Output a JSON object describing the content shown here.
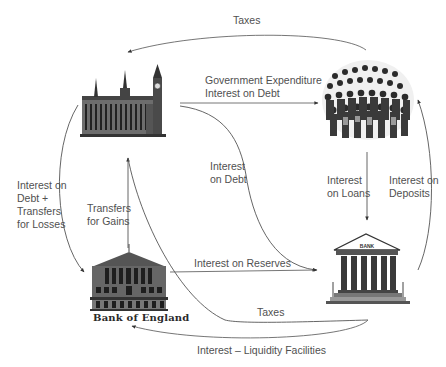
{
  "diagram": {
    "nodes": {
      "government": {
        "name": "Government (Houses of Parliament)",
        "icon": "parliament-icon"
      },
      "public": {
        "name": "Households & Firms (people crowd)",
        "icon": "crowd-icon"
      },
      "central_bank": {
        "name": "Bank of England",
        "caption": "Bank of England",
        "icon": "bank-of-england-icon"
      },
      "commercial_banks": {
        "name": "Commercial Banks",
        "sign": "BANK",
        "icon": "commercial-bank-icon"
      }
    },
    "flows": {
      "taxes_public_to_gov": {
        "label": "Taxes",
        "from": "public",
        "to": "government"
      },
      "gov_expenditure": {
        "label": "Government Expenditure\nInterest on Debt",
        "from": "government",
        "to": "public"
      },
      "interest_on_debt_gov_to_banks": {
        "label": "Interest\non Debt",
        "from": "government",
        "to": "commercial_banks"
      },
      "interest_loans": {
        "label": "Interest\non Loans",
        "from": "public",
        "to": "commercial_banks"
      },
      "interest_deposits": {
        "label": "Interest on\nDeposits",
        "from": "commercial_banks",
        "to": "public"
      },
      "gov_to_boe": {
        "label": "Interest on\nDebt +\nTransfers\nfor Losses",
        "from": "government",
        "to": "central_bank"
      },
      "transfers_gains": {
        "label": "Transfers\nfor Gains",
        "from": "central_bank",
        "to": "government"
      },
      "interest_reserves": {
        "label": "Interest on Reserves",
        "from": "central_bank",
        "to": "commercial_banks"
      },
      "taxes_banks_to_gov": {
        "label": "Taxes",
        "from": "commercial_banks",
        "to": "government"
      },
      "liquidity_facilities": {
        "label": "Interest – Liquidity Facilities",
        "from": "commercial_banks",
        "to": "central_bank"
      }
    },
    "colors": {
      "line": "#555555",
      "text": "#505050",
      "ink": "#222222"
    }
  }
}
